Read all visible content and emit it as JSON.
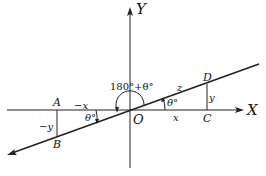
{
  "diagram": {
    "axes": {
      "x_label": "X",
      "y_label": "Y",
      "origin_label": "O"
    },
    "points": {
      "A": "A",
      "B": "B",
      "C": "C",
      "D": "D"
    },
    "segments": {
      "neg_x": "−x",
      "pos_x": "x",
      "neg_y": "−y",
      "pos_y": "y",
      "hyp": "z"
    },
    "angles": {
      "theta_right": "θ°",
      "theta_left": "θ°",
      "big": "180°+θ°"
    }
  }
}
